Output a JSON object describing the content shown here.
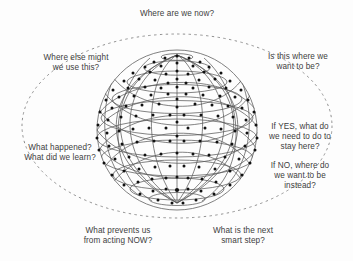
{
  "diagram": {
    "center_graphic": "wireframe-globe",
    "boundary": "dashed-ellipse",
    "colors": {
      "background": "#fdfdfd",
      "text": "#3d3d3d",
      "globe_line": "#555555",
      "globe_node": "#111111",
      "dashed_ellipse": "#8a8a8a"
    },
    "labels": {
      "top": "Where are we now?",
      "top_right": "Is this where we\nwant to be?",
      "right_yes": "If YES, what do\nwe need to do to\nstay here?",
      "right_no": "If NO, where do\nwe want to be\ninstead?",
      "bottom_right": "What is the next\nsmart step?",
      "bottom_left": "What prevents us\nfrom acting NOW?",
      "left_learn": "What happened?\nWhat did we learn?",
      "top_left": "Where else might\nwe use this?"
    }
  }
}
